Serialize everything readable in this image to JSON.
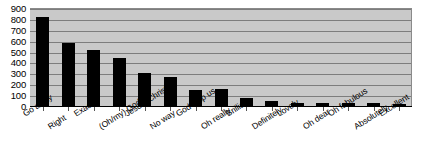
{
  "chart_data": {
    "type": "bar",
    "title": "",
    "xlabel": "",
    "ylabel": "",
    "ylim": [
      0,
      900
    ],
    "ytick_step": 100,
    "yticks": [
      0,
      100,
      200,
      300,
      400,
      500,
      600,
      700,
      800,
      900
    ],
    "grid": true,
    "legend": false,
    "bar_color": "#000000",
    "plot_background": "#c9c9c9",
    "gridline_color": "#7d7d7d",
    "categories": [
      "Go away",
      "Right",
      "Exactly",
      "(Oh/my) God",
      "Jesus (Christ)",
      "No way",
      "God help us",
      "Oh really",
      "Brilliant",
      "Definitely",
      "Lovely",
      "Oh dear",
      "Oh fabulous",
      "Absolutely",
      "Excellent"
    ],
    "values": [
      820,
      580,
      510,
      440,
      300,
      270,
      145,
      155,
      75,
      50,
      30,
      25,
      25,
      25,
      22
    ]
  }
}
